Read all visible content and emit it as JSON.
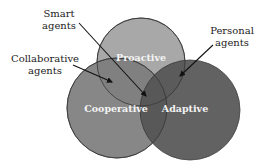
{
  "diagram": {
    "type": "venn",
    "sets": [
      {
        "id": "proactive",
        "label": "Proactive",
        "color": "#a8a8a8"
      },
      {
        "id": "cooperative",
        "label": "Cooperative",
        "color": "#7d7d7d"
      },
      {
        "id": "adaptive",
        "label": "Adaptive",
        "color": "#555555"
      }
    ],
    "annotations": [
      {
        "id": "smart",
        "lines": [
          "Smart",
          "agents"
        ],
        "points_to": "intersection of proactive, cooperative and adaptive"
      },
      {
        "id": "collaborative",
        "lines": [
          "Collaborative",
          "agents"
        ],
        "points_to": "intersection of proactive and cooperative"
      },
      {
        "id": "personal",
        "lines": [
          "Personal",
          "agents"
        ],
        "points_to": "intersection of proactive and adaptive"
      }
    ],
    "outline_color": "#333333",
    "arrow_color": "#111111"
  }
}
